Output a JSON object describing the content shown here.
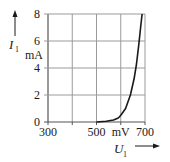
{
  "chart_data": {
    "type": "line",
    "title": "",
    "xlabel": "U1",
    "xunit": "mV",
    "ylabel": "I1",
    "yunit": "mA",
    "xlim": [
      300,
      700
    ],
    "ylim": [
      0,
      8
    ],
    "x_ticks": [
      300,
      400,
      500,
      600,
      700
    ],
    "x_tick_labels": [
      "300",
      "",
      "500",
      "mV",
      "700"
    ],
    "y_ticks": [
      0,
      2,
      4,
      6,
      8
    ],
    "y_tick_labels": [
      "0",
      "2",
      "4",
      "6",
      "8"
    ],
    "grid": true,
    "legend": null,
    "series": [
      {
        "name": "I1(U1) diode forward characteristic",
        "x": [
          500,
          540,
          570,
          590,
          600,
          620,
          640,
          655,
          665,
          675,
          682,
          688
        ],
        "y": [
          0,
          0.05,
          0.15,
          0.3,
          0.5,
          1.0,
          2.0,
          3.2,
          4.3,
          5.8,
          7.0,
          8.0
        ]
      }
    ]
  },
  "labels": {
    "y_axis_symbol": "I",
    "y_axis_subscript": "1",
    "y_axis_unit": "mA",
    "x_axis_symbol": "U",
    "x_axis_subscript": "1",
    "x_axis_unit": "mV"
  },
  "colors": {
    "grid": "#9a9a9a",
    "axis": "#555555",
    "curve": "#1a1a1a",
    "text": "#1a1a1a"
  }
}
